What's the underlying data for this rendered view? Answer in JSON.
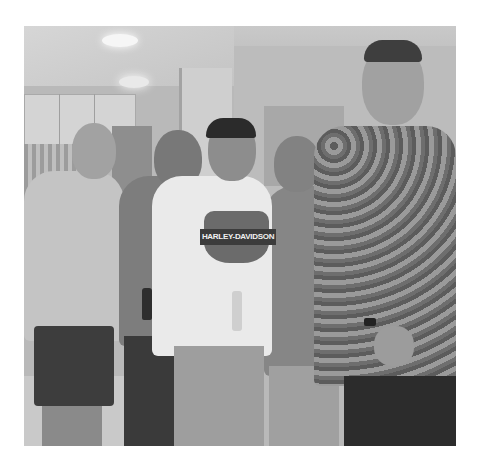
{
  "image": {
    "type": "photograph",
    "color_mode": "grayscale",
    "description": "Five men posing together indoors in a kitchen area",
    "people_count": 5,
    "visible_text": {
      "shirt_logo": "HARLEY-DAVIDSON"
    },
    "frame": {
      "left": 24,
      "top": 26,
      "width": 432,
      "height": 420
    },
    "background_color": "#ffffff"
  }
}
